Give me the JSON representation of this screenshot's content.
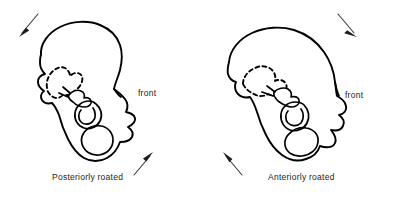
{
  "figure": {
    "type": "anatomical-line-diagram",
    "background_color": "#ffffff",
    "line_color": "#000000",
    "arrow_color": "#1d1d1d"
  },
  "panels": [
    {
      "id": "posterior-rotation",
      "caption": "Posteriorly roated",
      "front_label": "front",
      "front_side": "right",
      "arrows": [
        {
          "name": "upper-arrow",
          "position": "top-left",
          "direction": "down-left",
          "meaning": "iliac crest moves posteriorly and downward"
        },
        {
          "name": "lower-arrow",
          "position": "bottom-right",
          "direction": "up-right",
          "meaning": "ischial tuberosity moves anteriorly and upward"
        }
      ],
      "parts": [
        "ilium",
        "sacrum (dashed)",
        "acetabulum",
        "obturator foramen",
        "ischium",
        "pubis"
      ]
    },
    {
      "id": "anterior-rotation",
      "caption": "Anteriorly roated",
      "front_label": "front",
      "front_side": "right",
      "arrows": [
        {
          "name": "upper-arrow",
          "position": "top-right",
          "direction": "down-right",
          "meaning": "iliac crest moves anteriorly and downward"
        },
        {
          "name": "lower-arrow",
          "position": "bottom-left",
          "direction": "up-left",
          "meaning": "ischial tuberosity moves posteriorly and upward"
        }
      ],
      "parts": [
        "ilium",
        "sacrum (dashed)",
        "acetabulum",
        "obturator foramen",
        "ischium",
        "pubis"
      ]
    }
  ]
}
